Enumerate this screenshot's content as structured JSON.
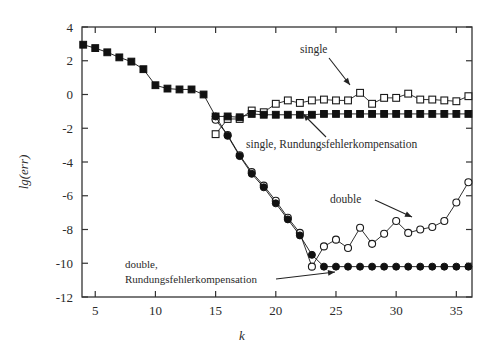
{
  "chart_data": {
    "type": "line",
    "title": "",
    "xlabel": "k",
    "ylabel": "lg(err)",
    "xlim": [
      3.9,
      36.3
    ],
    "ylim": [
      -12,
      4
    ],
    "xticks": [
      5,
      10,
      15,
      20,
      25,
      30,
      35
    ],
    "yticks": [
      4,
      2,
      0,
      -2,
      -4,
      -6,
      -8,
      -10,
      -12
    ],
    "xtick_labels": [
      "5",
      "10",
      "15",
      "20",
      "25",
      "30",
      "35"
    ],
    "ytick_labels": [
      "4",
      "2",
      "0",
      "-2",
      "-4",
      "-6",
      "-8",
      "-10",
      "-12"
    ],
    "grid": false,
    "legend_position": "inline-annotations",
    "series": [
      {
        "name": "single",
        "marker": "open-square",
        "color": "#1a1a1a",
        "x": [
          15,
          16,
          17,
          18,
          19,
          20,
          21,
          22,
          23,
          24,
          25,
          26,
          27,
          28,
          29,
          30,
          31,
          32,
          33,
          34,
          35,
          36
        ],
        "y": [
          -2.35,
          -1.45,
          -1.45,
          -0.95,
          -1.05,
          -0.55,
          -0.35,
          -0.5,
          -0.35,
          -0.3,
          -0.35,
          -0.35,
          0.1,
          -0.55,
          -0.2,
          -0.2,
          0.05,
          -0.3,
          -0.3,
          -0.35,
          -0.4,
          -0.1
        ]
      },
      {
        "name": "single, Rundungsfehlerkompensation",
        "marker": "filled-square",
        "color": "#111111",
        "x": [
          4,
          5,
          6,
          7,
          8,
          9,
          10,
          11,
          12,
          13,
          14,
          15,
          16,
          17,
          18,
          19,
          20,
          21,
          22,
          23,
          24,
          25,
          26,
          27,
          28,
          29,
          30,
          31,
          32,
          33,
          34,
          35,
          36
        ],
        "y": [
          2.95,
          2.75,
          2.5,
          2.2,
          1.95,
          1.5,
          0.55,
          0.35,
          0.3,
          0.3,
          0.0,
          -1.3,
          -1.3,
          -1.35,
          -1.15,
          -1.2,
          -1.2,
          -1.2,
          -1.2,
          -1.2,
          -1.15,
          -1.15,
          -1.15,
          -1.15,
          -1.15,
          -1.15,
          -1.15,
          -1.15,
          -1.15,
          -1.15,
          -1.15,
          -1.15,
          -1.15
        ]
      },
      {
        "name": "double",
        "marker": "open-circle",
        "color": "#1a1a1a",
        "x": [
          15,
          16,
          17,
          18,
          19,
          20,
          21,
          22,
          23,
          24,
          25,
          26,
          27,
          28,
          29,
          30,
          31,
          32,
          33,
          34,
          35,
          36
        ],
        "y": [
          -1.5,
          -2.4,
          -3.6,
          -4.6,
          -5.4,
          -6.3,
          -7.3,
          -8.2,
          -10.2,
          -9.0,
          -8.6,
          -9.1,
          -7.9,
          -8.85,
          -8.25,
          -7.5,
          -8.2,
          -8.0,
          -7.85,
          -7.5,
          -6.4,
          -5.2
        ]
      },
      {
        "name": "double, Rundungsfehlerkompensation",
        "marker": "filled-circle",
        "color": "#111111",
        "x": [
          15,
          16,
          17,
          18,
          19,
          20,
          21,
          22,
          23,
          24,
          25,
          26,
          27,
          28,
          29,
          30,
          31,
          32,
          33,
          34,
          35,
          36
        ],
        "y": [
          -1.3,
          -2.45,
          -3.65,
          -4.7,
          -5.5,
          -6.45,
          -7.4,
          -8.35,
          -9.5,
          -10.2,
          -10.2,
          -10.2,
          -10.2,
          -10.2,
          -10.2,
          -10.2,
          -10.2,
          -10.2,
          -10.2,
          -10.2,
          -10.2,
          -10.2
        ]
      }
    ],
    "annotations": [
      {
        "text": "single",
        "x_px": 300,
        "y_px": 53
      },
      {
        "text": "single, Rundungsfehlerkompensation",
        "x_px": 246,
        "y_px": 148
      },
      {
        "text": "double",
        "x_px": 330,
        "y_px": 203
      },
      {
        "text": "double,",
        "x_px": 125,
        "y_px": 268
      },
      {
        "text": "Rundungsfehlerkompensation",
        "x_px": 125,
        "y_px": 283
      }
    ]
  }
}
